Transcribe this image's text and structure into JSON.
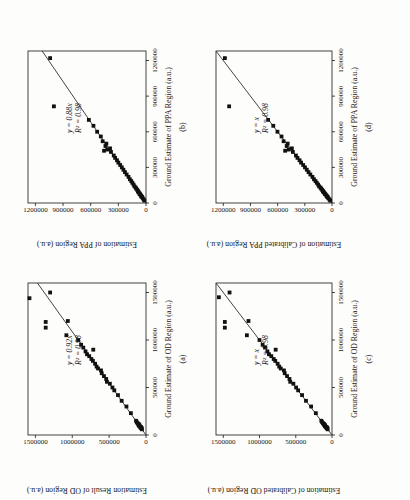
{
  "figure": {
    "orientation_note": "figure rotated 90 degrees counter-clockwise on page",
    "background": "#fdfdfc",
    "ink_color": "#161616",
    "marker_color": "#111111",
    "fit_line_color": "#2f2f2f"
  },
  "chart_data": [
    {
      "type": "scatter",
      "panel": "a",
      "panel_label": "(a)",
      "xlabel": "Ground Estimate of OD Region (a.u.)",
      "ylabel": "Estimation Result of OD Region (a.u.)",
      "equation": "y = 0.92x",
      "r_squared": "R² = 0.98",
      "fit_slope": 0.92,
      "xlim": [
        0,
        1600000
      ],
      "ylim": [
        0,
        1600000
      ],
      "xticks": [
        0,
        500000,
        1000000,
        1500000
      ],
      "yticks": [
        0,
        500000,
        1000000,
        1500000
      ],
      "grid": false,
      "legend": "none",
      "points": [
        [
          60000,
          55000
        ],
        [
          70000,
          65000
        ],
        [
          75000,
          60000
        ],
        [
          80000,
          75000
        ],
        [
          85000,
          70000
        ],
        [
          90000,
          85000
        ],
        [
          95000,
          90000
        ],
        [
          100000,
          88000
        ],
        [
          105000,
          95000
        ],
        [
          110000,
          105000
        ],
        [
          115000,
          98000
        ],
        [
          125000,
          115000
        ],
        [
          135000,
          125000
        ],
        [
          150000,
          135000
        ],
        [
          230000,
          205000
        ],
        [
          300000,
          265000
        ],
        [
          360000,
          330000
        ],
        [
          420000,
          380000
        ],
        [
          470000,
          430000
        ],
        [
          500000,
          455000
        ],
        [
          540000,
          490000
        ],
        [
          560000,
          530000
        ],
        [
          590000,
          540000
        ],
        [
          620000,
          570000
        ],
        [
          650000,
          600000
        ],
        [
          680000,
          610000
        ],
        [
          700000,
          650000
        ],
        [
          720000,
          670000
        ],
        [
          750000,
          690000
        ],
        [
          780000,
          720000
        ],
        [
          800000,
          740000
        ],
        [
          830000,
          770000
        ],
        [
          850000,
          800000
        ],
        [
          880000,
          820000
        ],
        [
          898000,
          715000
        ],
        [
          920000,
          850000
        ],
        [
          950000,
          880000
        ],
        [
          1000000,
          920000
        ],
        [
          1050000,
          1080000
        ],
        [
          1130000,
          1360000
        ],
        [
          1190000,
          1360000
        ],
        [
          1200000,
          1060000
        ],
        [
          1440000,
          1580000
        ],
        [
          1500000,
          1300000
        ]
      ]
    },
    {
      "type": "scatter",
      "panel": "b",
      "panel_label": "(b)",
      "xlabel": "Ground Estimate of PPA Region (a.u.)",
      "ylabel": "Estimation of PPA Region (a.u.)",
      "equation": "y = 0.88x",
      "r_squared": "R² = 0.98",
      "fit_slope": 0.88,
      "xlim": [
        0,
        1280000
      ],
      "ylim": [
        0,
        1280000
      ],
      "xticks": [
        0,
        300000,
        600000,
        900000,
        1200000
      ],
      "yticks": [
        0,
        300000,
        600000,
        900000,
        1200000
      ],
      "grid": false,
      "legend": "none",
      "points": [
        [
          20000,
          18000
        ],
        [
          30000,
          25000
        ],
        [
          40000,
          35000
        ],
        [
          50000,
          42000
        ],
        [
          55000,
          50000
        ],
        [
          60000,
          52000
        ],
        [
          70000,
          60000
        ],
        [
          75000,
          68000
        ],
        [
          80000,
          70000
        ],
        [
          90000,
          78000
        ],
        [
          95000,
          85000
        ],
        [
          100000,
          88000
        ],
        [
          110000,
          95000
        ],
        [
          120000,
          105000
        ],
        [
          130000,
          112000
        ],
        [
          140000,
          125000
        ],
        [
          155000,
          135000
        ],
        [
          170000,
          148000
        ],
        [
          185000,
          160000
        ],
        [
          200000,
          175000
        ],
        [
          220000,
          190000
        ],
        [
          240000,
          210000
        ],
        [
          260000,
          228000
        ],
        [
          280000,
          245000
        ],
        [
          300000,
          262000
        ],
        [
          320000,
          280000
        ],
        [
          340000,
          300000
        ],
        [
          360000,
          315000
        ],
        [
          380000,
          335000
        ],
        [
          400000,
          350000
        ],
        [
          430000,
          380000
        ],
        [
          440000,
          455000
        ],
        [
          450000,
          420000
        ],
        [
          460000,
          390000
        ],
        [
          480000,
          440000
        ],
        [
          500000,
          430000
        ],
        [
          520000,
          470000
        ],
        [
          560000,
          490000
        ],
        [
          600000,
          530000
        ],
        [
          650000,
          570000
        ],
        [
          700000,
          620000
        ],
        [
          814000,
          999000
        ],
        [
          1220000,
          1040000
        ]
      ]
    },
    {
      "type": "scatter",
      "panel": "c",
      "panel_label": "(c)",
      "xlabel": "Ground Estimate of OD Region (a.u.)",
      "ylabel": "Estimation of Calibrated OD Region (a.u.)",
      "equation": "y = x",
      "r_squared": "R² = 0.98",
      "fit_slope": 1,
      "xlim": [
        0,
        1600000
      ],
      "ylim": [
        0,
        1600000
      ],
      "xticks": [
        0,
        500000,
        1000000,
        1500000
      ],
      "yticks": [
        0,
        500000,
        1000000,
        1500000
      ],
      "grid": false,
      "legend": "none",
      "points": [
        [
          60000,
          60000
        ],
        [
          70000,
          71000
        ],
        [
          75000,
          65000
        ],
        [
          80000,
          82000
        ],
        [
          85000,
          76000
        ],
        [
          90000,
          92000
        ],
        [
          95000,
          98000
        ],
        [
          100000,
          96000
        ],
        [
          105000,
          103000
        ],
        [
          110000,
          114000
        ],
        [
          115000,
          107000
        ],
        [
          125000,
          125000
        ],
        [
          135000,
          136000
        ],
        [
          150000,
          147000
        ],
        [
          230000,
          223000
        ],
        [
          300000,
          288000
        ],
        [
          360000,
          359000
        ],
        [
          420000,
          413000
        ],
        [
          470000,
          467000
        ],
        [
          500000,
          495000
        ],
        [
          540000,
          533000
        ],
        [
          560000,
          576000
        ],
        [
          590000,
          587000
        ],
        [
          620000,
          620000
        ],
        [
          650000,
          652000
        ],
        [
          680000,
          663000
        ],
        [
          700000,
          707000
        ],
        [
          720000,
          728000
        ],
        [
          750000,
          750000
        ],
        [
          780000,
          783000
        ],
        [
          800000,
          804000
        ],
        [
          830000,
          837000
        ],
        [
          850000,
          870000
        ],
        [
          880000,
          891000
        ],
        [
          898000,
          777000
        ],
        [
          920000,
          924000
        ],
        [
          950000,
          957000
        ],
        [
          1000000,
          1000000
        ],
        [
          1050000,
          1174000
        ],
        [
          1130000,
          1478000
        ],
        [
          1190000,
          1478000
        ],
        [
          1200000,
          1152000
        ],
        [
          1450000,
          1560000
        ],
        [
          1500000,
          1413000
        ]
      ]
    },
    {
      "type": "scatter",
      "panel": "d",
      "panel_label": "(d)",
      "xlabel": "Ground Estimate of PPA Region (a.u.)",
      "ylabel": "Estimation of Calibrated PPA Region (a.u.)",
      "equation": "y = x",
      "r_squared": "R² = 0.98",
      "fit_slope": 1,
      "xlim": [
        0,
        1280000
      ],
      "ylim": [
        0,
        1280000
      ],
      "xticks": [
        0,
        300000,
        600000,
        900000,
        1200000
      ],
      "yticks": [
        0,
        300000,
        600000,
        900000,
        1200000
      ],
      "grid": false,
      "legend": "none",
      "points": [
        [
          20000,
          20000
        ],
        [
          30000,
          28000
        ],
        [
          40000,
          40000
        ],
        [
          50000,
          48000
        ],
        [
          55000,
          57000
        ],
        [
          60000,
          59000
        ],
        [
          70000,
          68000
        ],
        [
          75000,
          77000
        ],
        [
          80000,
          80000
        ],
        [
          90000,
          89000
        ],
        [
          95000,
          97000
        ],
        [
          100000,
          100000
        ],
        [
          110000,
          108000
        ],
        [
          120000,
          119000
        ],
        [
          130000,
          127000
        ],
        [
          140000,
          142000
        ],
        [
          155000,
          153000
        ],
        [
          170000,
          168000
        ],
        [
          185000,
          182000
        ],
        [
          200000,
          199000
        ],
        [
          220000,
          216000
        ],
        [
          240000,
          239000
        ],
        [
          260000,
          259000
        ],
        [
          280000,
          278000
        ],
        [
          300000,
          298000
        ],
        [
          320000,
          318000
        ],
        [
          340000,
          341000
        ],
        [
          360000,
          358000
        ],
        [
          380000,
          381000
        ],
        [
          400000,
          398000
        ],
        [
          430000,
          432000
        ],
        [
          440000,
          517000
        ],
        [
          450000,
          477000
        ],
        [
          460000,
          443000
        ],
        [
          480000,
          500000
        ],
        [
          500000,
          489000
        ],
        [
          520000,
          534000
        ],
        [
          560000,
          557000
        ],
        [
          600000,
          602000
        ],
        [
          650000,
          648000
        ],
        [
          700000,
          705000
        ],
        [
          814000,
          1135000
        ],
        [
          1220000,
          1182000
        ]
      ]
    }
  ]
}
